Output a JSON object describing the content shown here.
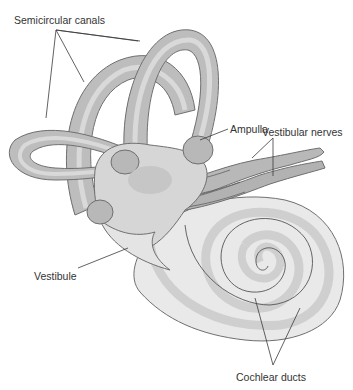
{
  "figure": {
    "colors": {
      "outer_wall": "#bdbdbd",
      "inner_band": "#d9d9d9",
      "duct": "#a9a9a9",
      "vestibule": "#d6d6d6",
      "cochlea_fill": "#e9e9e9",
      "cochlea_band": "#cfcfcf",
      "nerve": "#b5b5b5",
      "outline": "#6f6f6f",
      "label_text": "#333333"
    },
    "labels": {
      "semicircular_canals": "Semicircular canals",
      "ampulla": "Ampulla",
      "vestibular_nerves": "Vestibular nerves",
      "vestibule": "Vestibule",
      "cochlear_ducts": "Cochlear ducts"
    }
  }
}
